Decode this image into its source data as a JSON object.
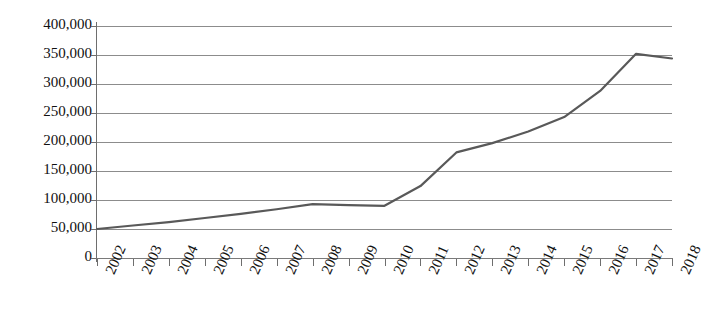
{
  "chart_data": {
    "type": "line",
    "title": "",
    "subtitle": "",
    "xlabel": "",
    "ylabel": "",
    "categories": [
      "2002",
      "2003",
      "2004",
      "2005",
      "2006",
      "2007",
      "2008",
      "2009",
      "2010",
      "2011",
      "2012",
      "2013",
      "2014",
      "2015",
      "2016",
      "2017",
      "2018"
    ],
    "series": [
      {
        "name": "",
        "values": [
          50000,
          56000,
          62000,
          69000,
          76000,
          84000,
          93000,
          91000,
          90000,
          124000,
          182000,
          198000,
          218000,
          243000,
          288000,
          352000,
          344000
        ]
      }
    ],
    "ylim": [
      0,
      400000
    ],
    "ytick_values": [
      0,
      50000,
      100000,
      150000,
      200000,
      250000,
      300000,
      350000,
      400000
    ],
    "ytick_labels": [
      "0",
      "50,000",
      "100,000",
      "150,000",
      "200,000",
      "250,000",
      "300,000",
      "350,000",
      "400,000"
    ],
    "grid": "horizontal",
    "legend": "none",
    "line_color": "#595959",
    "grid_color": "#8c8c8c",
    "axis_color": "#6e6e6e",
    "background": "#ffffff",
    "xtick_rotation": -66
  }
}
